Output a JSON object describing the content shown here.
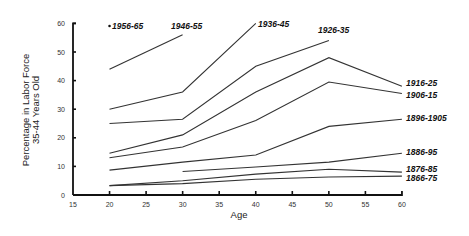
{
  "chart_data": {
    "type": "line",
    "title": "",
    "xlabel": "Age",
    "ylabel": [
      "Percentage in Labor Force",
      "35-44 Years Old"
    ],
    "xlim": [
      15,
      60
    ],
    "ylim": [
      0,
      60
    ],
    "x_ticks": [
      15,
      20,
      25,
      30,
      35,
      40,
      45,
      50,
      55,
      60
    ],
    "y_ticks": [
      0,
      10,
      20,
      30,
      40,
      50,
      60
    ],
    "grid": false,
    "legend": "inline labels at line ends",
    "series": [
      {
        "name": "1956-65",
        "x": [
          20
        ],
        "values": [
          59
        ],
        "label_pos": [
          112,
          29
        ],
        "marker": "dot"
      },
      {
        "name": "1946-55",
        "x": [
          20,
          30
        ],
        "values": [
          44,
          56
        ],
        "label_pos": [
          171,
          29
        ]
      },
      {
        "name": "1936-45",
        "x": [
          20,
          30,
          40
        ],
        "values": [
          30,
          36,
          60
        ],
        "label_pos": [
          258,
          27
        ]
      },
      {
        "name": "1926-35",
        "x": [
          20,
          30,
          40,
          50
        ],
        "values": [
          25,
          26.5,
          45,
          54
        ],
        "label_pos": [
          318,
          33
        ]
      },
      {
        "name": "1916-25",
        "x": [
          20,
          30,
          40,
          50,
          60
        ],
        "values": [
          14.6,
          21,
          36,
          48,
          38
        ],
        "label_pos": [
          406,
          86
        ]
      },
      {
        "name": "1906-15",
        "x": [
          20,
          30,
          40,
          50,
          60
        ],
        "values": [
          13,
          16.8,
          26,
          39.5,
          35.5
        ],
        "label_pos": [
          406,
          98
        ]
      },
      {
        "name": "1896-1905",
        "x": [
          20,
          30,
          40,
          50,
          60
        ],
        "values": [
          8.7,
          11.5,
          14,
          24,
          26.5
        ],
        "label_pos": [
          406,
          121
        ]
      },
      {
        "name": "1886-95",
        "x": [
          30,
          40,
          50,
          60
        ],
        "values": [
          8.2,
          9.8,
          11.5,
          14.6
        ],
        "label_pos": [
          406,
          155
        ]
      },
      {
        "name": "1876-85",
        "x": [
          20,
          30,
          40,
          50,
          60
        ],
        "values": [
          3.3,
          5,
          7.3,
          9,
          8
        ],
        "label_pos": [
          406,
          172
        ]
      },
      {
        "name": "1866-75",
        "x": [
          20,
          30,
          40,
          50,
          60
        ],
        "values": [
          3.3,
          4,
          5.5,
          6.3,
          6.6
        ],
        "label_pos": [
          406,
          181
        ]
      }
    ]
  }
}
